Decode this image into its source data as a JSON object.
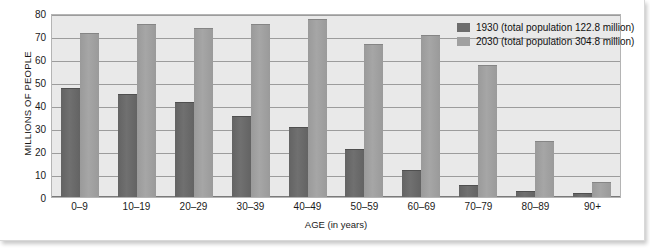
{
  "chart_data": {
    "type": "bar",
    "title": "",
    "xlabel": "AGE (in years)",
    "ylabel": "MILLIONS OF PEOPLE",
    "ylim": [
      0,
      80
    ],
    "yticks": [
      0,
      10,
      20,
      30,
      40,
      50,
      60,
      70,
      80
    ],
    "grid": true,
    "legend_position": "top-right",
    "categories": [
      "0–9",
      "10–19",
      "20–29",
      "30–39",
      "40–49",
      "50–59",
      "60–69",
      "70–79",
      "80–89",
      "90+"
    ],
    "series": [
      {
        "name": "1930 (total population 122.8 million)",
        "short_name": "1930",
        "color": "#6d6d6d",
        "values": [
          47,
          44.5,
          41,
          35,
          30,
          20.5,
          11.5,
          5,
          2,
          1.5
        ]
      },
      {
        "name": "2030 (total population 304.8 million)",
        "short_name": "2030",
        "color": "#a0a0a0",
        "values": [
          71,
          75,
          73,
          75,
          77,
          66,
          70,
          57,
          24,
          6
        ]
      }
    ]
  },
  "legend": {
    "items": [
      {
        "label": "1930 (total population 122.8 million)"
      },
      {
        "label": "2030 (total population 304.8 million)"
      }
    ]
  }
}
